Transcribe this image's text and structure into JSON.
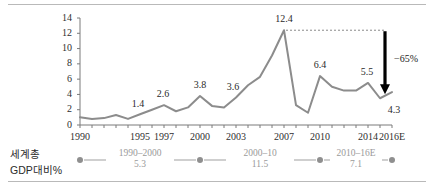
{
  "chart_data": {
    "type": "line",
    "title": "",
    "subtitle": "",
    "xlabel": "",
    "ylabel": "",
    "ylim": [
      0,
      14
    ],
    "xlim": [
      1990,
      2016
    ],
    "grid": false,
    "legend": "none",
    "y_ticks": [
      "0",
      "2",
      "4",
      "6",
      "8",
      "10",
      "12",
      "14"
    ],
    "x_ticks": [
      "1990",
      "1995",
      "1997",
      "2000",
      "2003",
      "2007",
      "2010",
      "2014",
      "2016E"
    ],
    "series": [
      {
        "name": "Global capital flows (% of world GDP)",
        "color": "#8c8c8c",
        "x": [
          1990,
          1991,
          1992,
          1993,
          1994,
          1995,
          1996,
          1997,
          1998,
          1999,
          2000,
          2001,
          2002,
          2003,
          2004,
          2005,
          2006,
          2007,
          2008,
          2009,
          2010,
          2011,
          2012,
          2013,
          2014,
          2015,
          2016
        ],
        "values": [
          1.0,
          0.8,
          0.9,
          1.3,
          0.8,
          1.4,
          2.0,
          2.6,
          1.8,
          2.3,
          3.8,
          2.5,
          2.3,
          3.6,
          5.2,
          6.3,
          9.1,
          12.4,
          2.6,
          1.6,
          6.4,
          5.0,
          4.5,
          4.5,
          5.5,
          3.5,
          4.3
        ]
      }
    ],
    "point_labels": [
      {
        "x": 1995,
        "value": "1.4"
      },
      {
        "x": 1997,
        "value": "2.6"
      },
      {
        "x": 2000,
        "value": "3.8"
      },
      {
        "x": 2003,
        "value": "3.6"
      },
      {
        "x": 2007,
        "value": "12.4"
      },
      {
        "x": 2010,
        "value": "6.4"
      },
      {
        "x": 2014,
        "value": "5.5"
      },
      {
        "x": 2016,
        "value": "4.3"
      }
    ],
    "annotations": [
      {
        "name": "decline-arrow",
        "label": "−65%",
        "from_value": 12.4,
        "to_value": 4.3,
        "at_x": 2016,
        "color": "#000000",
        "style": "dashed-guide-with-down-arrow"
      }
    ]
  },
  "footer": {
    "title_line1": "세계총",
    "title_line2": "GDP대비%",
    "segments": [
      {
        "range": "1990–2000",
        "value": "5.3"
      },
      {
        "range": "2000–10",
        "value": "11.5"
      },
      {
        "range": "2010–16E",
        "value": "7.1"
      }
    ],
    "dot_color": "#8f8f8f",
    "connector_color": "#9f9f9f"
  }
}
